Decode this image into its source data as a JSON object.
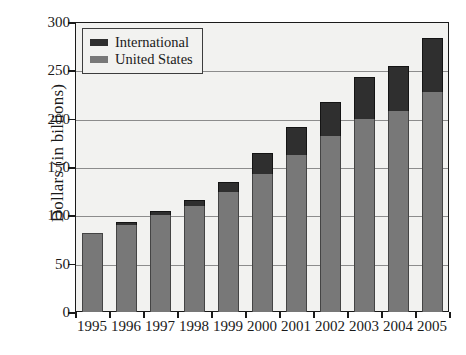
{
  "chart_data": {
    "type": "bar",
    "subtype": "stacked-vertical",
    "title": "",
    "xlabel": "",
    "ylabel": "Dollars (in billions)",
    "ylim": [
      0,
      300
    ],
    "yticks": [
      0,
      50,
      100,
      150,
      200,
      250,
      300
    ],
    "ytick_labels": [
      "0",
      "50",
      "100",
      "150",
      "200",
      "250",
      "300"
    ],
    "grid": true,
    "grid_axis": "y",
    "legend_position": "top-left-inside",
    "categories": [
      "1995",
      "1996",
      "1997",
      "1998",
      "1999",
      "2000",
      "2001",
      "2002",
      "2003",
      "2004",
      "2005"
    ],
    "series": [
      {
        "name": "International",
        "color": "#2f2f2f",
        "values": [
          0,
          3,
          4,
          6,
          11,
          21,
          29,
          35,
          43,
          47,
          55
        ]
      },
      {
        "name": "United States",
        "color": "#787878",
        "values": [
          82,
          90,
          100,
          110,
          124,
          143,
          162,
          182,
          200,
          208,
          228
        ]
      }
    ],
    "stack_order": [
      "United States",
      "International"
    ],
    "totals": [
      82,
      93,
      104,
      116,
      135,
      164,
      191,
      217,
      243,
      255,
      283
    ]
  },
  "axes": {
    "y_title": "Dollars (in billions)"
  },
  "legend": {
    "entries": [
      {
        "label": "International",
        "swatch": "#2f2f2f"
      },
      {
        "label": "United States",
        "swatch": "#787878"
      }
    ]
  }
}
